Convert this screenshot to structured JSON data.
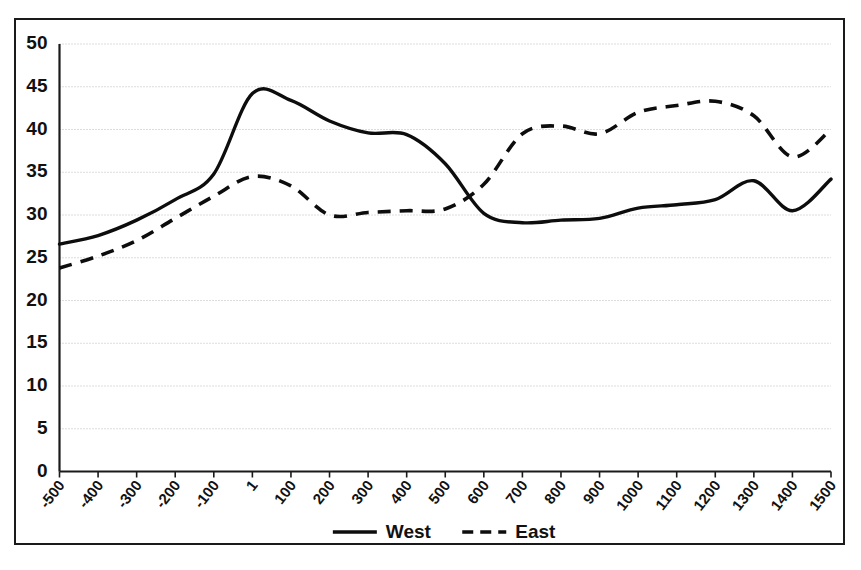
{
  "chart_data": {
    "type": "line",
    "title": "",
    "subtitle": "",
    "xlabel": "",
    "ylabel": "",
    "xlim": [
      0,
      20
    ],
    "ylim": [
      0,
      50
    ],
    "ytick_step": 5,
    "grid": true,
    "legend_position": "bottom-center",
    "categories": [
      "-500",
      "-400",
      "-300",
      "-200",
      "-100",
      "1",
      "100",
      "200",
      "300",
      "400",
      "500",
      "600",
      "700",
      "800",
      "900",
      "1000",
      "1100",
      "1200",
      "1300",
      "1400",
      "1500"
    ],
    "yticks": [
      "0",
      "5",
      "10",
      "15",
      "20",
      "25",
      "30",
      "35",
      "40",
      "45",
      "50"
    ],
    "series": [
      {
        "name": "West",
        "style": "solid",
        "color": "#0d0d0d",
        "values": [
          26.6,
          27.6,
          29.4,
          31.8,
          34.8,
          44.2,
          43.4,
          41.0,
          39.6,
          39.4,
          36.0,
          30.2,
          29.1,
          29.4,
          29.6,
          30.8,
          31.2,
          31.8,
          34.0,
          30.5,
          34.2
        ]
      },
      {
        "name": "East",
        "style": "dashed",
        "color": "#0d0d0d",
        "values": [
          23.8,
          25.2,
          27.0,
          29.6,
          32.2,
          34.5,
          33.4,
          30.0,
          30.3,
          30.5,
          30.7,
          33.6,
          39.5,
          40.4,
          39.5,
          42.0,
          42.8,
          43.3,
          41.6,
          36.8,
          40.0
        ]
      }
    ],
    "legend": [
      {
        "label": "West",
        "style": "solid"
      },
      {
        "label": "East",
        "style": "dashed"
      }
    ],
    "colors": {
      "line": "#0d0d0d",
      "grid": "#b9b9b9",
      "axis": "#1a1a1a",
      "background": "#ffffff",
      "text": "#111111"
    }
  }
}
